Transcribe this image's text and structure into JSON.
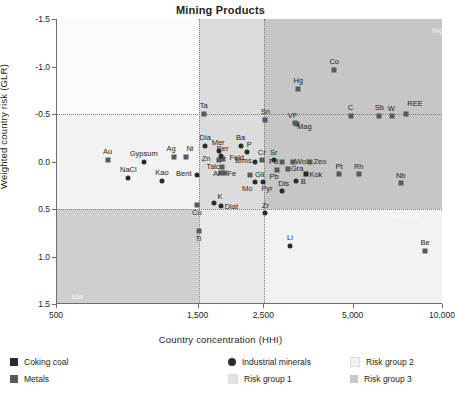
{
  "chart_data": {
    "type": "scatter",
    "title": "Mining Products",
    "xlabel": "Country concentration (HHI)",
    "ylabel": "Weighted country risk (GLR)",
    "xscale": "log",
    "xlim": [
      500,
      10000
    ],
    "ylim": [
      -1.5,
      1.5
    ],
    "y_inverted": true,
    "xticks": [
      "500",
      "1,500",
      "2,500",
      "5,000",
      "10,000"
    ],
    "xtick_values": [
      500,
      1500,
      2500,
      5000,
      10000
    ],
    "yticks": [
      "-1.5",
      "-1.0",
      "-0.5",
      "0.0",
      "0.5",
      "1.0",
      "1.5"
    ],
    "ytick_values": [
      -1.5,
      -1.0,
      -0.5,
      0.0,
      0.5,
      1.0,
      1.5
    ],
    "grid": "dotted-threshold-lines",
    "threshold_x": [
      1500,
      2500
    ],
    "threshold_y": [
      -0.5,
      0.5
    ],
    "annotations": [
      {
        "text": "threshold",
        "orient": "vertical",
        "x": 1500,
        "y": -1.25
      },
      {
        "text": "threshold",
        "orient": "horizontal",
        "x": 7200,
        "y": 0.57
      },
      {
        "text": "high",
        "orient": "horizontal",
        "x": 9200,
        "y": -1.38
      },
      {
        "text": "low",
        "orient": "horizontal",
        "x": 560,
        "y": 1.42
      }
    ],
    "series": [
      {
        "name": "Coking coal",
        "marker": "square",
        "color": "#2b2b2b",
        "points": [
          {
            "label": "Kok",
            "x": 3450,
            "y": 0.13
          }
        ]
      },
      {
        "name": "Metals",
        "marker": "square",
        "color": "#58595b",
        "points": [
          {
            "label": "Co",
            "x": 4300,
            "y": -0.96
          },
          {
            "label": "Hg",
            "x": 3250,
            "y": -0.76
          },
          {
            "label": "Ta",
            "x": 1560,
            "y": -0.5
          },
          {
            "label": "Sn",
            "x": 2520,
            "y": -0.44
          },
          {
            "label": "VF",
            "x": 3160,
            "y": -0.41
          },
          {
            "label": "Mag",
            "x": 3230,
            "y": -0.39
          },
          {
            "label": "C",
            "x": 4880,
            "y": -0.48
          },
          {
            "label": "Sb",
            "x": 6100,
            "y": -0.48
          },
          {
            "label": "W",
            "x": 6750,
            "y": -0.48
          },
          {
            "label": "REE",
            "x": 7500,
            "y": -0.5
          },
          {
            "label": "Au",
            "x": 740,
            "y": -0.02
          },
          {
            "label": "Ag",
            "x": 1240,
            "y": -0.05
          },
          {
            "label": "Ni",
            "x": 1360,
            "y": -0.05
          },
          {
            "label": "Zn",
            "x": 1760,
            "y": -0.02
          },
          {
            "label": "Feld",
            "x": 1810,
            "y": -0.03
          },
          {
            "label": "Talc",
            "x": 1800,
            "y": 0.06
          },
          {
            "label": "Al",
            "x": 1790,
            "y": 0.12
          },
          {
            "label": "Fe",
            "x": 1840,
            "y": 0.12
          },
          {
            "label": "Cr",
            "x": 2450,
            "y": -0.02
          },
          {
            "label": "Pd",
            "x": 2860,
            "y": 0.01
          },
          {
            "label": "Wol",
            "x": 3110,
            "y": 0.01
          },
          {
            "label": "Zeo",
            "x": 3560,
            "y": 0.01
          },
          {
            "label": "Pb",
            "x": 2760,
            "y": 0.09
          },
          {
            "label": "Gra",
            "x": 3010,
            "y": 0.08
          },
          {
            "label": "Pt",
            "x": 4460,
            "y": 0.13
          },
          {
            "label": "Rh",
            "x": 5200,
            "y": 0.13
          },
          {
            "label": "Nb",
            "x": 7200,
            "y": 0.23
          },
          {
            "label": "Gli",
            "x": 2230,
            "y": 0.14
          },
          {
            "label": "Cu",
            "x": 1480,
            "y": 0.46
          },
          {
            "label": "Ti",
            "x": 1500,
            "y": 0.73
          },
          {
            "label": "Be",
            "x": 8700,
            "y": 0.94
          }
        ]
      },
      {
        "name": "Industrial minerals",
        "marker": "circle",
        "color": "#2b2b2b",
        "points": [
          {
            "label": "Dia",
            "x": 1580,
            "y": -0.16
          },
          {
            "label": "Ba",
            "x": 2080,
            "y": -0.16
          },
          {
            "label": "P",
            "x": 2190,
            "y": -0.1
          },
          {
            "label": "Mer",
            "x": 1760,
            "y": -0.11
          },
          {
            "label": "Per",
            "x": 1780,
            "y": -0.06
          },
          {
            "label": "Gypsum",
            "x": 980,
            "y": 0.0
          },
          {
            "label": "NaCl",
            "x": 870,
            "y": 0.17
          },
          {
            "label": "Kao",
            "x": 1130,
            "y": 0.2
          },
          {
            "label": "Bent",
            "x": 1480,
            "y": 0.14
          },
          {
            "label": "Bims",
            "x": 2330,
            "y": 0.0
          },
          {
            "label": "Sr",
            "x": 2690,
            "y": -0.02
          },
          {
            "label": "Mo",
            "x": 2330,
            "y": 0.22
          },
          {
            "label": "Pyr",
            "x": 2470,
            "y": 0.22
          },
          {
            "label": "B",
            "x": 3200,
            "y": 0.2
          },
          {
            "label": "Dis",
            "x": 2860,
            "y": 0.31
          },
          {
            "label": "K",
            "x": 1690,
            "y": 0.44
          },
          {
            "label": "Diat",
            "x": 1790,
            "y": 0.47
          },
          {
            "label": "Zr",
            "x": 2520,
            "y": 0.54
          },
          {
            "label": "Li",
            "x": 3050,
            "y": 0.89
          }
        ]
      }
    ]
  },
  "legend": {
    "columns": [
      {
        "items": [
          {
            "label": "Coking coal",
            "marker": "square",
            "color": "#2b2b2b"
          },
          {
            "label": "Metals",
            "marker": "square",
            "color": "#58595b"
          }
        ]
      },
      {
        "items": [
          {
            "label": "Industrial minerals",
            "marker": "circle",
            "color": "#2b2b2b"
          },
          {
            "label": "Risk group 1",
            "marker": "square",
            "color": "#e3e3e3"
          }
        ]
      },
      {
        "items": [
          {
            "label": "Risk group 2",
            "marker": "square",
            "color": "#f3f3f3"
          },
          {
            "label": "Risk group 3",
            "marker": "square",
            "color": "#c9c9c9"
          }
        ]
      }
    ]
  }
}
